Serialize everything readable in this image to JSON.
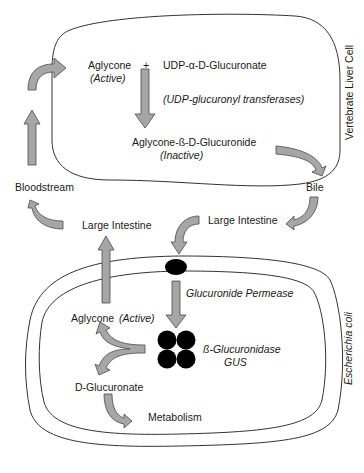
{
  "diagram": {
    "liver_cell": {
      "label": "Vertebrate Liver Cell",
      "aglycone": "Aglycone",
      "aglycone_state": "(Active)",
      "plus": "+",
      "udp": "UDP-α-D-Glucuronate",
      "enzyme": "(UDP-glucuronyl transferases)",
      "product": "Aglycone-ß-D-Glucuronide",
      "product_state": "(Inactive)"
    },
    "external": {
      "bile": "Bile",
      "large_intestine_right": "Large Intestine",
      "large_intestine_left": "Large Intestine",
      "bloodstream": "Bloodstream"
    },
    "ecoli": {
      "label": "Escherichia coli",
      "permease": "Glucuronide Permease",
      "gus_name": "ß-Glucuronidase",
      "gus_abbr": "GUS",
      "aglycone": "Aglycone",
      "aglycone_state": "(Active)",
      "glucuronate": "D-Glucuronate",
      "metabolism": "Metabolism"
    },
    "colors": {
      "arrow_fill": "#a6a6a6",
      "arrow_stroke": "#4a4a4a",
      "line": "#333333",
      "protein": "#000000"
    }
  }
}
